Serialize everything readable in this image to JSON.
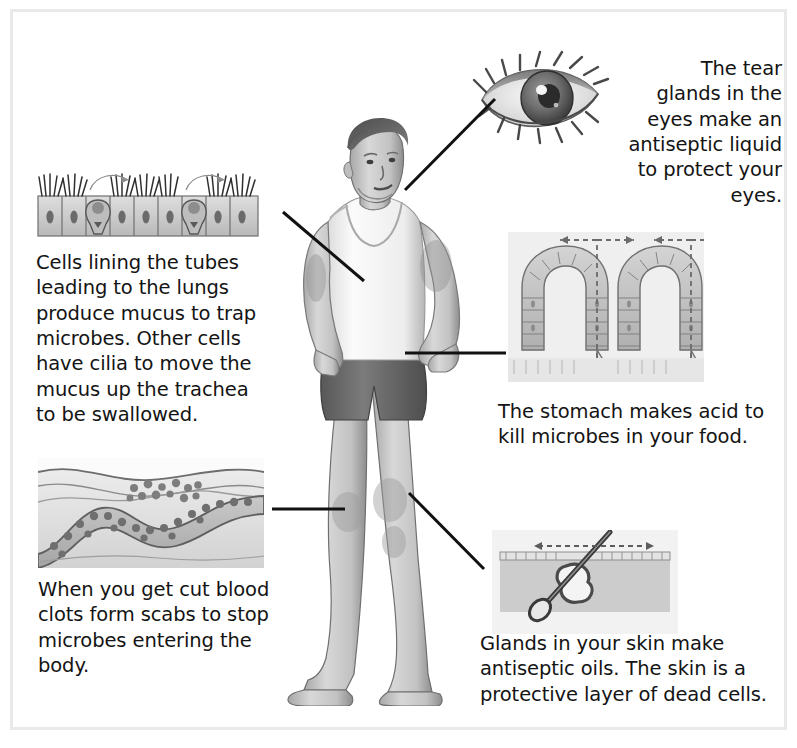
{
  "page": {
    "background_color": "#ffffff",
    "frame_color": "#e9e9e9",
    "text_color": "#141414"
  },
  "figure": {
    "name": "boy-standing-figure",
    "clothing_top": "white vest",
    "clothing_bottom": "dark shorts"
  },
  "callouts": [
    {
      "id": "tear-glands",
      "label": "The tear\nglands in the\neyes make an\nantiseptic liquid\nto protect your eyes.",
      "illustration": "eye-illustration",
      "illustration_alt": "Close-up drawing of a human eye with eyelashes",
      "align": "right"
    },
    {
      "id": "cilia-mucus",
      "label": "Cells lining the tubes\nleading to the lungs\nproduce mucus to trap\nmicrobes. Other cells\nhave cilia to move the\nmucus up the trachea\nto be swallowed.",
      "illustration": "ciliated-epithelium-illustration",
      "illustration_alt": "Row of ciliated cells with goblet cells producing mucus",
      "align": "left"
    },
    {
      "id": "stomach-acid",
      "label": "The stomach makes acid to\nkill microbes in your food.",
      "illustration": "stomach-lining-illustration",
      "illustration_alt": "Cross-section of stomach lining showing gastric pits with dashed arrows",
      "align": "left"
    },
    {
      "id": "blood-clot",
      "label": "When you get cut blood\nclots form scabs to stop\nmicrobes entering the\nbody.",
      "illustration": "blood-clot-illustration",
      "illustration_alt": "Cross-section of skin with a blood vessel and blood cells forming a clot",
      "align": "left"
    },
    {
      "id": "skin-glands",
      "label": "Glands in your skin make\nantiseptic oils. The skin is a\nprotective layer of dead cells.",
      "illustration": "hair-follicle-illustration",
      "illustration_alt": "Cross-section of skin showing a hair follicle and sebaceous gland",
      "align": "left"
    }
  ],
  "leader_lines": [
    {
      "id": "leader-eye",
      "from": "head",
      "to": "eye-illustration"
    },
    {
      "id": "leader-cilia",
      "from": "chest",
      "to": "ciliated-epithelium-illustration"
    },
    {
      "id": "leader-stomach",
      "from": "abdomen",
      "to": "stomach-lining-illustration"
    },
    {
      "id": "leader-blood",
      "from": "knee",
      "to": "blood-clot-illustration"
    },
    {
      "id": "leader-skin",
      "from": "thigh",
      "to": "hair-follicle-illustration"
    }
  ]
}
